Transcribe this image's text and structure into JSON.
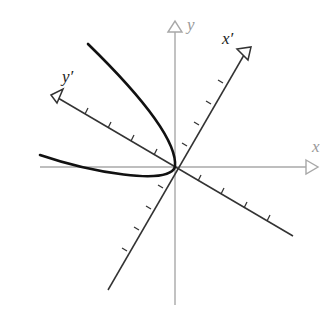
{
  "diagram": {
    "labels": {
      "x": "x",
      "y": "y",
      "x_prime": "x′",
      "y_prime": "y′"
    },
    "colors": {
      "original_axes": "#a8a8a8",
      "rotated_axes": "#333333",
      "curve": "#111111",
      "background": "#ffffff"
    },
    "origin": [
      175,
      167
    ],
    "rotation_angle_deg": 58,
    "tick_count_per_direction": 4,
    "curve": "parabola opening along negative y′ axis, vertex at origin"
  }
}
